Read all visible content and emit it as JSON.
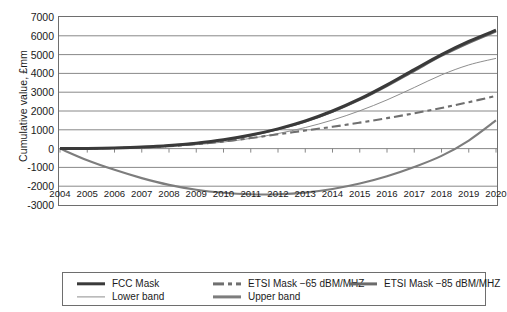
{
  "chart_data": {
    "type": "line",
    "title": "",
    "xlabel": "",
    "ylabel": "Cumulative value, £mm",
    "xlim": [
      2004,
      2020
    ],
    "ylim": [
      -3000,
      7000
    ],
    "grid": true,
    "legend_position": "bottom",
    "categories": [
      2004,
      2005,
      2006,
      2007,
      2008,
      2009,
      2010,
      2011,
      2012,
      2013,
      2014,
      2015,
      2016,
      2017,
      2018,
      2019,
      2020
    ],
    "ytick_labels": [
      "7000",
      "6000",
      "5000",
      "4000",
      "3000",
      "2000",
      "1000",
      "0",
      "-1000",
      "-2000",
      "-3000"
    ],
    "ytick_values": [
      7000,
      6000,
      5000,
      4000,
      3000,
      2000,
      1000,
      0,
      -1000,
      -2000,
      -3000
    ],
    "xtick_labels": [
      "2004",
      "2005",
      "2006",
      "2007",
      "2008",
      "2009",
      "2010",
      "2011",
      "2012",
      "2013",
      "2014",
      "2015",
      "2016",
      "2017",
      "2018",
      "2019",
      "2020"
    ],
    "series": [
      {
        "name": "FCC Mask",
        "style": "solid",
        "width": "thick",
        "color": "#3a3a3a",
        "values": [
          0,
          10,
          35,
          80,
          160,
          290,
          470,
          720,
          1050,
          1470,
          2000,
          2640,
          3390,
          4200,
          5000,
          5700,
          6300
        ]
      },
      {
        "name": "ETSI Mask −65 dBM/MHZ",
        "style": "dashed",
        "width": "medium",
        "color": "#6f6f6f",
        "values": [
          0,
          8,
          28,
          65,
          130,
          235,
          380,
          560,
          760,
          960,
          1160,
          1380,
          1620,
          1880,
          2160,
          2470,
          2800
        ]
      },
      {
        "name": "ETSI Mask −85 dBM/MHZ",
        "style": "solid",
        "width": "medium",
        "color": "#6b6b6b",
        "values": [
          0,
          10,
          34,
          78,
          156,
          282,
          460,
          705,
          1030,
          1440,
          1960,
          2590,
          3330,
          4130,
          4930,
          5620,
          6230
        ]
      },
      {
        "name": "Lower band",
        "style": "solid",
        "width": "thin",
        "color": "#8e8e8e",
        "values": [
          0,
          5,
          20,
          55,
          115,
          210,
          350,
          545,
          800,
          1120,
          1520,
          2010,
          2590,
          3250,
          3920,
          4450,
          4800
        ]
      },
      {
        "name": "Upper band",
        "style": "solid",
        "width": "medium",
        "color": "#7d7d7d",
        "values": [
          0,
          -620,
          -1130,
          -1570,
          -1930,
          -2190,
          -2350,
          -2430,
          -2430,
          -2340,
          -2150,
          -1860,
          -1470,
          -980,
          -390,
          430,
          1500
        ]
      }
    ]
  },
  "legend": {
    "items": [
      {
        "label": "FCC Mask",
        "swatch": "sw-fcc"
      },
      {
        "label": "ETSI Mask −65 dBM/MHZ",
        "swatch": "sw-e65"
      },
      {
        "label": "ETSI Mask −85 dBM/MHZ",
        "swatch": "sw-e85"
      },
      {
        "label": "Lower band",
        "swatch": "sw-lower"
      },
      {
        "label": "Upper band",
        "swatch": "sw-upper"
      }
    ]
  },
  "colors": {
    "axis": "#6e6e6e",
    "grid": "#7a7a7a",
    "text": "#1a1a1a",
    "background": "#ffffff"
  }
}
